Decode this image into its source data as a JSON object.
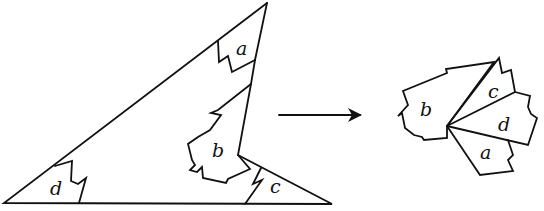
{
  "diagram": {
    "left_figure": {
      "name": "triangle",
      "labels": {
        "a": "a",
        "b": "b",
        "c": "c",
        "d": "d"
      }
    },
    "arrow": {
      "direction": "right"
    },
    "right_figure": {
      "name": "rearranged-corners",
      "labels": {
        "a": "a",
        "b": "b",
        "c": "c",
        "d": "d"
      }
    },
    "colors": {
      "ink": "#111111",
      "background": "#ffffff"
    }
  }
}
